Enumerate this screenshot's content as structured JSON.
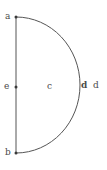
{
  "figure": {
    "type": "geometry-diagram",
    "shape": "semicircle",
    "background_color": "#ffffff",
    "stroke_color": "#555555",
    "label_color": "#4a4a4a",
    "canvas": {
      "width": 107,
      "height": 170
    },
    "labels": {
      "a": "a",
      "b": "b",
      "e": "e",
      "c": "c",
      "d1": "d",
      "d2": "d"
    },
    "points": [
      {
        "name": "a",
        "x": 16,
        "y": 17,
        "marker": true
      },
      {
        "name": "e",
        "x": 16,
        "y": 87,
        "marker": true
      },
      {
        "name": "b",
        "x": 16,
        "y": 153,
        "marker": true
      }
    ],
    "geometry": {
      "diameter_line": {
        "x1": 16,
        "y1": 17,
        "x2": 16,
        "y2": 153
      },
      "arc": {
        "start_x": 16,
        "start_y": 17,
        "end_x": 16,
        "end_y": 153,
        "rx": 64,
        "ry": 68,
        "bulge_direction": "right",
        "max_x": 80
      }
    }
  }
}
